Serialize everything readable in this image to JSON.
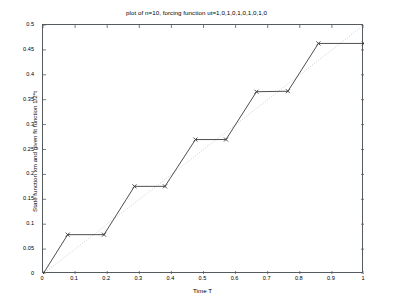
{
  "chart_data": {
    "type": "line",
    "title": "plot of n=10, forcing function ut=1,0,1,0,1,0,1,0,1,0",
    "xlabel": "Time T",
    "ylabel": "State function xm and given fit function 1/2*t",
    "xlim": [
      0,
      1
    ],
    "ylim": [
      0,
      0.5
    ],
    "grid": false,
    "legend": "none",
    "xticks": [
      "0",
      "0.1",
      "0.2",
      "0.3",
      "0.4",
      "0.5",
      "0.6",
      "0.7",
      "0.8",
      "0.9",
      "1"
    ],
    "xtick_values": [
      0,
      0.1,
      0.2,
      0.3,
      0.4,
      0.5,
      0.6,
      0.7,
      0.8,
      0.9,
      1
    ],
    "yticks": [
      "0",
      "0.05",
      "0.1",
      "0.15",
      "0.2",
      "0.25",
      "0.3",
      "0.35",
      "0.4",
      "0.45",
      "0.5"
    ],
    "ytick_values": [
      0,
      0.05,
      0.1,
      0.15,
      0.2,
      0.25,
      0.3,
      0.35,
      0.4,
      0.45,
      0.5
    ],
    "series": [
      {
        "name": "State function xm",
        "style": "solid-with-x-markers",
        "color": "#3a3a3a",
        "marker": "x",
        "x": [
          0,
          0.077,
          0.19,
          0.285,
          0.38,
          0.475,
          0.57,
          0.665,
          0.763,
          0.858,
          1.0
        ],
        "y": [
          0.0,
          0.079,
          0.079,
          0.176,
          0.176,
          0.27,
          0.27,
          0.366,
          0.367,
          0.463,
          0.463
        ]
      },
      {
        "name": "given fit function 1/2*t",
        "style": "dotted",
        "color": "#c8c8c8",
        "marker": "none",
        "x": [
          0,
          1
        ],
        "y": [
          0,
          0.5
        ]
      }
    ],
    "forcing_function": [
      1,
      0,
      1,
      0,
      1,
      0,
      1,
      0,
      1,
      0
    ],
    "n": 10
  },
  "axes": {
    "box_color": "#555a5e"
  }
}
